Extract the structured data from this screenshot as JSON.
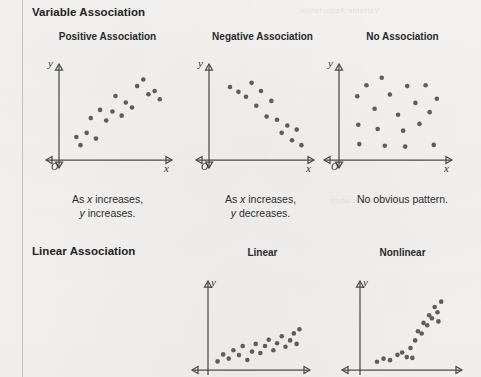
{
  "page": {
    "background_color": "#f2f1ef",
    "margin_rule_color": "#b9b7b4",
    "ink_color": "#2b2b2b",
    "dot_color": "#5d5d5d",
    "axis_color": "#4a4a4a"
  },
  "bleed_text": {
    "line1": "Variable Association",
    "line2": "Linear Association"
  },
  "sections": {
    "variable": {
      "heading": "Variable Association",
      "columns": [
        {
          "key": "positive",
          "heading": "Positive Association",
          "caption_line1": "As x increases,",
          "caption_line2": "y increases.",
          "caption_italic_1": "x",
          "caption_italic_2": "y"
        },
        {
          "key": "negative",
          "heading": "Negative Association",
          "caption_line1": "As x increases,",
          "caption_line2": "y decreases.",
          "caption_italic_1": "x",
          "caption_italic_2": "y"
        },
        {
          "key": "none",
          "heading": "No Association",
          "caption_line1": "No obvious pattern.",
          "caption_line2": "",
          "caption_italic_1": "",
          "caption_italic_2": ""
        }
      ]
    },
    "linear": {
      "heading": "Linear Association",
      "columns": [
        {
          "key": "linear",
          "heading": "Linear",
          "caption_line1": "",
          "caption_line2": ""
        },
        {
          "key": "nonlinear",
          "heading": "Nonlinear",
          "caption_line1": "",
          "caption_line2": ""
        }
      ]
    }
  },
  "axis_labels": {
    "x": "x",
    "y": "y",
    "origin": "O"
  },
  "chart_data": [
    {
      "id": "positive-association",
      "type": "scatter",
      "title": "Positive Association",
      "xlabel": "x",
      "ylabel": "y",
      "xlim": [
        0,
        100
      ],
      "ylim": [
        0,
        100
      ],
      "grid": false,
      "legend": "none",
      "annotation": "As x increases, y increases.",
      "points": [
        [
          12,
          22
        ],
        [
          16,
          12
        ],
        [
          22,
          27
        ],
        [
          26,
          45
        ],
        [
          31,
          20
        ],
        [
          35,
          55
        ],
        [
          41,
          42
        ],
        [
          47,
          53
        ],
        [
          50,
          72
        ],
        [
          56,
          48
        ],
        [
          60,
          64
        ],
        [
          66,
          58
        ],
        [
          71,
          84
        ],
        [
          77,
          92
        ],
        [
          82,
          74
        ],
        [
          88,
          78
        ],
        [
          93,
          68
        ]
      ]
    },
    {
      "id": "negative-association",
      "type": "scatter",
      "title": "Negative Association",
      "xlabel": "x",
      "ylabel": "y",
      "xlim": [
        0,
        100
      ],
      "ylim": [
        0,
        100
      ],
      "grid": false,
      "legend": "none",
      "annotation": "As x increases, y decreases.",
      "points": [
        [
          17,
          83
        ],
        [
          26,
          77
        ],
        [
          34,
          71
        ],
        [
          40,
          88
        ],
        [
          45,
          60
        ],
        [
          50,
          78
        ],
        [
          56,
          47
        ],
        [
          61,
          66
        ],
        [
          67,
          43
        ],
        [
          72,
          27
        ],
        [
          78,
          36
        ],
        [
          83,
          18
        ],
        [
          88,
          31
        ],
        [
          93,
          12
        ]
      ]
    },
    {
      "id": "no-association",
      "type": "scatter",
      "title": "No Association",
      "xlabel": "x",
      "ylabel": "y",
      "xlim": [
        0,
        100
      ],
      "ylim": [
        0,
        100
      ],
      "grid": false,
      "legend": "none",
      "annotation": "No obvious pattern.",
      "points": [
        [
          13,
          70
        ],
        [
          14,
          36
        ],
        [
          15,
          13
        ],
        [
          22,
          83
        ],
        [
          30,
          55
        ],
        [
          33,
          31
        ],
        [
          37,
          92
        ],
        [
          40,
          11
        ],
        [
          45,
          72
        ],
        [
          53,
          48
        ],
        [
          58,
          29
        ],
        [
          60,
          10
        ],
        [
          62,
          82
        ],
        [
          70,
          62
        ],
        [
          74,
          37
        ],
        [
          80,
          83
        ],
        [
          84,
          51
        ],
        [
          88,
          12
        ],
        [
          91,
          67
        ]
      ]
    },
    {
      "id": "linear-association",
      "type": "scatter",
      "title": "Linear",
      "xlabel": "x",
      "ylabel": "y",
      "xlim": [
        0,
        100
      ],
      "ylim": [
        0,
        100
      ],
      "grid": false,
      "legend": "none",
      "points": [
        [
          6,
          8
        ],
        [
          12,
          18
        ],
        [
          18,
          12
        ],
        [
          23,
          24
        ],
        [
          29,
          17
        ],
        [
          33,
          30
        ],
        [
          38,
          10
        ],
        [
          43,
          22
        ],
        [
          47,
          33
        ],
        [
          52,
          20
        ],
        [
          57,
          30
        ],
        [
          61,
          39
        ],
        [
          66,
          24
        ],
        [
          70,
          34
        ],
        [
          75,
          44
        ],
        [
          79,
          29
        ],
        [
          84,
          38
        ],
        [
          88,
          48
        ],
        [
          91,
          33
        ],
        [
          94,
          54
        ]
      ]
    },
    {
      "id": "nonlinear-association",
      "type": "scatter",
      "title": "Nonlinear",
      "xlabel": "x",
      "ylabel": "y",
      "xlim": [
        0,
        100
      ],
      "ylim": [
        0,
        100
      ],
      "grid": false,
      "legend": "none",
      "points": [
        [
          14,
          7
        ],
        [
          21,
          11
        ],
        [
          28,
          9
        ],
        [
          36,
          16
        ],
        [
          41,
          19
        ],
        [
          46,
          13
        ],
        [
          52,
          12
        ],
        [
          50,
          25
        ],
        [
          55,
          35
        ],
        [
          58,
          47
        ],
        [
          62,
          44
        ],
        [
          64,
          58
        ],
        [
          68,
          55
        ],
        [
          70,
          68
        ],
        [
          73,
          64
        ],
        [
          76,
          79
        ],
        [
          79,
          72
        ],
        [
          83,
          86
        ],
        [
          80,
          60
        ]
      ]
    }
  ]
}
